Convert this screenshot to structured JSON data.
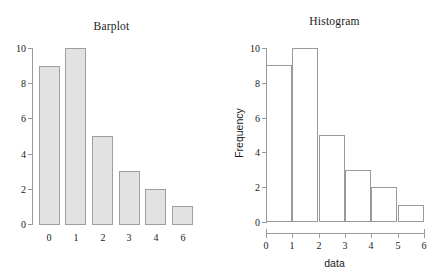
{
  "figure": {
    "background": "#ffffff",
    "axis_color": "#9a9a9a",
    "text_color": "#1a1a1a"
  },
  "chart_data": [
    {
      "type": "bar",
      "title": "Barplot",
      "xlabel": "",
      "ylabel": "",
      "categories": [
        "0",
        "1",
        "2",
        "3",
        "4",
        "6"
      ],
      "values": [
        9,
        10,
        5,
        3,
        2,
        1
      ],
      "ylim": [
        0,
        10
      ],
      "yticks": [
        0,
        2,
        4,
        6,
        8,
        10
      ],
      "ytick_labels": [
        "0",
        "2",
        "4",
        "6",
        "8",
        "10"
      ],
      "grid": false,
      "legend": false,
      "bar_fill": "#e2e2e2",
      "bar_border": "#9e9e9e",
      "bars_touching": false,
      "xaxis_line": false
    },
    {
      "type": "histogram",
      "title": "Histogram",
      "xlabel": "data",
      "ylabel": "Frequency",
      "bin_edges": [
        0,
        1,
        2,
        3,
        4,
        5,
        6
      ],
      "counts": [
        9,
        10,
        5,
        3,
        2,
        1
      ],
      "categories": [
        "[0,1)",
        "[1,2)",
        "[2,3)",
        "[3,4)",
        "[4,5)",
        "[5,6)"
      ],
      "values": [
        9,
        10,
        5,
        3,
        2,
        1
      ],
      "xlim": [
        0,
        6
      ],
      "ylim": [
        0,
        10
      ],
      "xticks": [
        0,
        1,
        2,
        3,
        4,
        5,
        6
      ],
      "xtick_labels": [
        "0",
        "1",
        "2",
        "3",
        "4",
        "5",
        "6"
      ],
      "yticks": [
        0,
        2,
        4,
        6,
        8,
        10
      ],
      "ytick_labels": [
        "0",
        "2",
        "4",
        "6",
        "8",
        "10"
      ],
      "grid": false,
      "legend": false,
      "bar_fill": "#ffffff",
      "bar_border": "#9a9a9a",
      "bars_touching": true,
      "xaxis_line": true
    }
  ]
}
